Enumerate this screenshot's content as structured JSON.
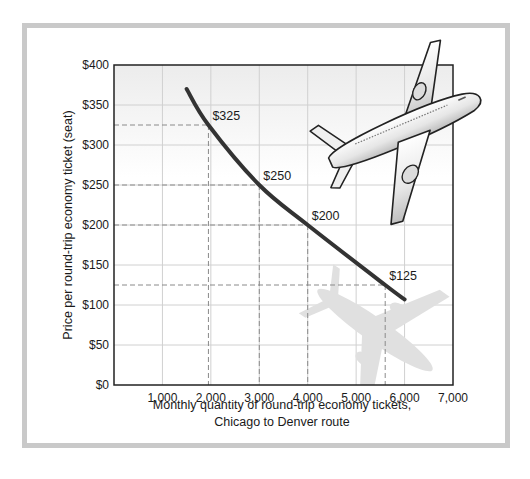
{
  "chart_data": {
    "type": "line",
    "title": "",
    "xlabel": "Monthly quantity of round-trip economy tickets, Chicago to Denver route",
    "xlabel_lines": [
      "Monthly quantity of round-trip economy tickets,",
      "Chicago to Denver route"
    ],
    "ylabel": "Price per round-trip economy ticket (seat)",
    "xlim": [
      0,
      7000
    ],
    "ylim": [
      0,
      400
    ],
    "x_ticks": [
      1000,
      2000,
      3000,
      4000,
      5000,
      6000,
      7000
    ],
    "x_tick_labels": [
      "1,000",
      "2,000",
      "3,000",
      "4,000",
      "5,000",
      "6,000",
      "7,000"
    ],
    "y_ticks": [
      0,
      50,
      100,
      150,
      200,
      250,
      300,
      350,
      400
    ],
    "y_tick_labels": [
      "$0",
      "$50",
      "$100",
      "$150",
      "$200",
      "$250",
      "$300",
      "$350",
      "$400"
    ],
    "grid": true,
    "legend": null,
    "series": [
      {
        "name": "Demand curve",
        "color": "#333333",
        "x": [
          1500,
          1950,
          3000,
          4000,
          5600,
          6000
        ],
        "y": [
          370,
          325,
          250,
          200,
          125,
          107
        ]
      }
    ],
    "annotations": [
      {
        "label": "$325",
        "x": 1950,
        "y": 325
      },
      {
        "label": "$250",
        "x": 3000,
        "y": 250
      },
      {
        "label": "$200",
        "x": 4000,
        "y": 200
      },
      {
        "label": "$125",
        "x": 5600,
        "y": 125
      }
    ],
    "decorations": [
      "airplane-illustration",
      "airplane-shadow"
    ]
  },
  "colors": {
    "frame_border": "#c9c9c9",
    "curve": "#333333",
    "grid": "#cfcfcf",
    "dashed_guides": "#8a8a8a",
    "axis": "#222222"
  }
}
